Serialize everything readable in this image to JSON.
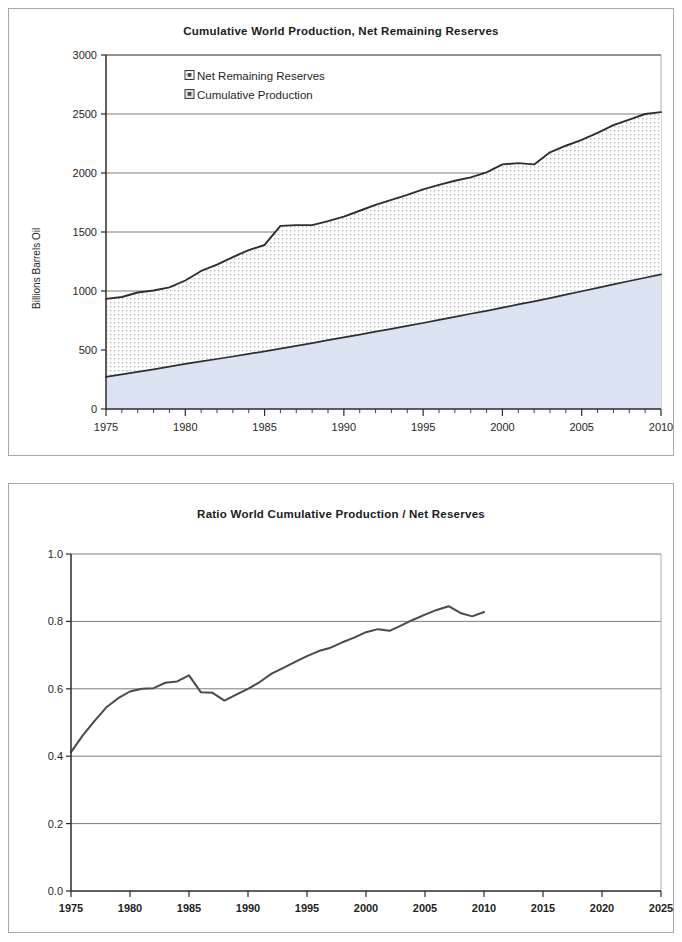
{
  "document": {
    "kind": "two-stacked-line-area-charts",
    "background_color": "#ffffff",
    "panel_border_color": "#a8a8a8"
  },
  "chart_data": [
    {
      "id": "cumulative-world-production-net-remaining-reserves",
      "type": "area",
      "stacked": true,
      "title": "Cumulative World Production, Net Remaining Reserves",
      "xlabel": "",
      "ylabel": "Billions Barrels Oil",
      "xlim": [
        1975,
        2010
      ],
      "ylim": [
        0,
        3000
      ],
      "xticks": [
        1975,
        1980,
        1985,
        1990,
        1995,
        2000,
        2005,
        2010
      ],
      "xtick_labels": [
        "1975",
        "1980",
        "1985",
        "1990",
        "1995",
        "2000",
        "2005",
        "2010"
      ],
      "yticks": [
        0,
        500,
        1000,
        1500,
        2000,
        2500,
        3000
      ],
      "ytick_labels": [
        "0",
        "500",
        "1000",
        "1500",
        "2000",
        "2500",
        "3000"
      ],
      "minor_xtick_interval": 1,
      "grid": "horizontal",
      "grid_color": "#6e6e6e",
      "legend_position": "inside-top-left",
      "legend": [
        {
          "label": "Net Remaining Reserves",
          "marker": "square-dotted",
          "fill": "#ffffff",
          "pattern": "dots",
          "pattern_color": "#b9b9b9"
        },
        {
          "label": "Cumulative Production",
          "marker": "square-filled",
          "fill": "#dbe3f2",
          "pattern": "solid"
        }
      ],
      "x": [
        1975,
        1976,
        1977,
        1978,
        1979,
        1980,
        1981,
        1982,
        1983,
        1984,
        1985,
        1986,
        1987,
        1988,
        1989,
        1990,
        1991,
        1992,
        1993,
        1994,
        1995,
        1996,
        1997,
        1998,
        1999,
        2000,
        2001,
        2002,
        2003,
        2004,
        2005,
        2006,
        2007,
        2008,
        2009,
        2010
      ],
      "series": [
        {
          "name": "Cumulative Production",
          "values": [
            272,
            293,
            315,
            336,
            359,
            382,
            403,
            424,
            445,
            467,
            489,
            512,
            535,
            559,
            583,
            607,
            631,
            655,
            679,
            704,
            729,
            755,
            781,
            807,
            832,
            859,
            886,
            912,
            940,
            969,
            998,
            1027,
            1056,
            1085,
            1112,
            1141
          ]
        },
        {
          "name": "Net Remaining Reserves",
          "values": [
            661,
            656,
            672,
            668,
            672,
            707,
            767,
            800,
            843,
            879,
            901,
            1040,
            1023,
            999,
            1009,
            1023,
            1049,
            1075,
            1094,
            1111,
            1132,
            1144,
            1153,
            1156,
            1174,
            1214,
            1198,
            1161,
            1235,
            1262,
            1282,
            1313,
            1349,
            1368,
            1388,
            1375
          ]
        },
        {
          "name": "Total (Cumulative Production + Net Remaining Reserves)",
          "values": [
            933,
            949,
            987,
            1004,
            1031,
            1089,
            1170,
            1224,
            1288,
            1346,
            1390,
            1552,
            1558,
            1558,
            1592,
            1630,
            1680,
            1730,
            1773,
            1815,
            1861,
            1899,
            1934,
            1963,
            2006,
            2073,
            2084,
            2073,
            2175,
            2231,
            2280,
            2340,
            2405,
            2453,
            2500,
            2516
          ]
        }
      ]
    },
    {
      "id": "ratio-world-cumulative-production-net-reserves",
      "type": "line",
      "title": "Ratio World Cumulative Production / Net Reserves",
      "xlabel": "",
      "ylabel": "",
      "xlim": [
        1975,
        2025
      ],
      "ylim": [
        0.0,
        1.0
      ],
      "xticks": [
        1975,
        1980,
        1985,
        1990,
        1995,
        2000,
        2005,
        2010,
        2015,
        2020,
        2025
      ],
      "xtick_labels": [
        "1975",
        "1980",
        "1985",
        "1990",
        "1995",
        "2000",
        "2005",
        "2010",
        "2015",
        "2020",
        "2025"
      ],
      "yticks": [
        0.0,
        0.2,
        0.4,
        0.6,
        0.8,
        1.0
      ],
      "ytick_labels": [
        "0.0",
        "0.2",
        "0.4",
        "0.6",
        "0.8",
        "1.0"
      ],
      "grid": "horizontal",
      "grid_color": "#6e6e6e",
      "line_color": "#4a4a4a",
      "legend_position": "none",
      "x": [
        1975,
        1976,
        1977,
        1978,
        1979,
        1980,
        1981,
        1982,
        1983,
        1984,
        1985,
        1986,
        1987,
        1988,
        1989,
        1990,
        1991,
        1992,
        1993,
        1994,
        1995,
        1996,
        1997,
        1998,
        1999,
        2000,
        2001,
        2002,
        2003,
        2004,
        2005,
        2006,
        2007,
        2008,
        2009,
        2010
      ],
      "series": [
        {
          "name": "Ratio Cumulative Production / Net Reserves",
          "values": [
            0.412,
            0.462,
            0.505,
            0.545,
            0.572,
            0.592,
            0.6,
            0.602,
            0.618,
            0.622,
            0.64,
            0.59,
            0.588,
            0.565,
            0.583,
            0.6,
            0.62,
            0.645,
            0.662,
            0.68,
            0.697,
            0.712,
            0.722,
            0.738,
            0.752,
            0.768,
            0.777,
            0.772,
            0.788,
            0.805,
            0.82,
            0.834,
            0.845,
            0.825,
            0.815,
            0.828
          ]
        }
      ]
    }
  ]
}
